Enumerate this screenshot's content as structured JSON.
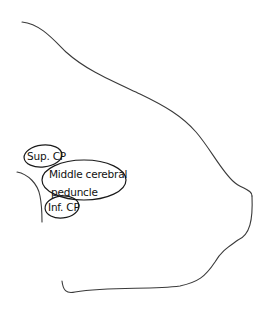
{
  "diagram": {
    "type": "anatomical-sketch",
    "labels": {
      "superior": "Sup. CP",
      "middle_line1": "Middle cerebral",
      "middle_line2": "peduncle",
      "inferior": "Inf. CP"
    },
    "colors": {
      "outline": "#3a3a3a",
      "bubble": "#1a1a1a",
      "text": "#111111",
      "background": "#ffffff"
    }
  }
}
